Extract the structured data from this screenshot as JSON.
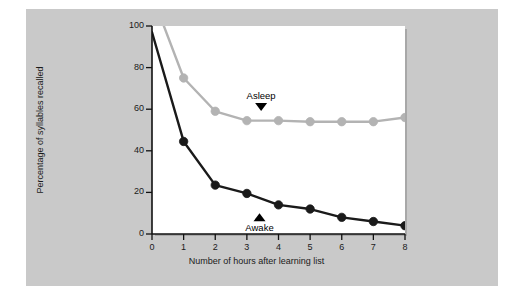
{
  "figure": {
    "background_color": "#ffffff",
    "panel_color": "#c9c9c9",
    "plot_background": "#ffffff"
  },
  "chart_data": {
    "type": "line",
    "title": "",
    "subtitle": "",
    "xlabel": "Number of hours after learning list",
    "ylabel": "Percentage of syllables recalled",
    "x": [
      0,
      1,
      2,
      3,
      4,
      5,
      6,
      7,
      8
    ],
    "xlim": [
      0,
      8
    ],
    "ylim": [
      0,
      100
    ],
    "xticks": [
      "0",
      "1",
      "2",
      "3",
      "4",
      "5",
      "6",
      "7",
      "8"
    ],
    "yticks": [
      "0",
      "20",
      "40",
      "60",
      "80",
      "100"
    ],
    "ytick_values": [
      0,
      20,
      40,
      60,
      80,
      100
    ],
    "grid": false,
    "legend": "inline-annotations",
    "series": [
      {
        "name": "Asleep",
        "color": "#b3b3b3",
        "marker": "circle",
        "values": [
          115,
          75,
          59,
          54.5,
          54.5,
          54,
          54,
          54,
          56
        ],
        "clipped_above_axis_max": true,
        "first_point_visible": false
      },
      {
        "name": "Awake",
        "color": "#1a1a1a",
        "marker": "circle",
        "values": [
          97,
          44.5,
          23.5,
          19.5,
          14,
          12,
          8,
          6,
          4
        ],
        "clipped_above_axis_max": false,
        "first_point_visible": false
      }
    ],
    "annotations": [
      {
        "text": "Asleep",
        "pointer": "triangle-down",
        "x": 3.45,
        "y": 63,
        "color": "#000000"
      },
      {
        "text": "Awake",
        "pointer": "triangle-up",
        "x": 3.4,
        "y": 10,
        "color": "#000000"
      }
    ]
  }
}
